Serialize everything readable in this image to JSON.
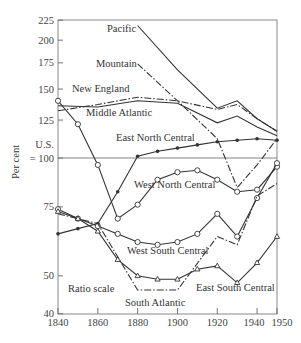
{
  "chart_data": {
    "type": "line",
    "title": "",
    "xlabel": "",
    "ylabel": "Per cent",
    "reference_label": [
      "U.S.",
      "= 100"
    ],
    "scale_note": "Ratio scale",
    "yscale": "log",
    "xlim": [
      1840,
      1950
    ],
    "ylim": [
      40,
      225
    ],
    "x_ticks": [
      1840,
      1860,
      1880,
      1900,
      1920,
      1940,
      1950
    ],
    "y_ticks": [
      40,
      50,
      75,
      100,
      125,
      150,
      175,
      200,
      225
    ],
    "series": [
      {
        "name": "Pacific",
        "style": "solid",
        "marker": "none",
        "x": [
          1880,
          1900,
          1920,
          1930,
          1940,
          1950
        ],
        "values": [
          218,
          168,
          134,
          140,
          126,
          117
        ]
      },
      {
        "name": "Mountain",
        "style": "dashdot",
        "marker": "none",
        "x": [
          1880,
          1900,
          1920,
          1930,
          1940,
          1950
        ],
        "values": [
          174,
          140,
          112,
          84,
          96,
          112
        ]
      },
      {
        "name": "New England",
        "style": "dashdot",
        "marker": "none",
        "x": [
          1840,
          1860,
          1880,
          1900,
          1920,
          1930,
          1940,
          1950
        ],
        "values": [
          132,
          137,
          143,
          140,
          133,
          137,
          126,
          117
        ]
      },
      {
        "name": "Middle Atlantic",
        "style": "solid",
        "marker": "none",
        "x": [
          1840,
          1860,
          1880,
          1900,
          1920,
          1930,
          1940,
          1950
        ],
        "values": [
          136,
          135,
          140,
          138,
          123,
          128,
          120,
          114
        ]
      },
      {
        "name": "East North Central",
        "style": "solid",
        "marker": "filled-circle",
        "x": [
          1840,
          1850,
          1860,
          1870,
          1880,
          1890,
          1900,
          1910,
          1920,
          1930,
          1940,
          1950
        ],
        "values": [
          64,
          66,
          68,
          82,
          101,
          104,
          106,
          108,
          110,
          111,
          112,
          111
        ]
      },
      {
        "name": "West North Central",
        "style": "solid",
        "marker": "open-circle",
        "x": [
          1840,
          1850,
          1860,
          1870,
          1880,
          1890,
          1900,
          1910,
          1920,
          1930,
          1940,
          1950
        ],
        "values": [
          140,
          122,
          96,
          70,
          76,
          88,
          92,
          93,
          88,
          82,
          83,
          95
        ]
      },
      {
        "name": "West South Central",
        "style": "solid",
        "marker": "open-circle",
        "x": [
          1840,
          1850,
          1860,
          1870,
          1880,
          1890,
          1900,
          1910,
          1920,
          1930,
          1940,
          1950
        ],
        "values": [
          74,
          70,
          67,
          64,
          61,
          60,
          61,
          64,
          72,
          63,
          79,
          97
        ]
      },
      {
        "name": "South Atlantic",
        "style": "dashdot",
        "marker": "none",
        "x": [
          1840,
          1860,
          1880,
          1900,
          1920,
          1930,
          1940,
          1950
        ],
        "values": [
          72,
          68,
          46,
          46,
          63,
          60,
          80,
          86
        ]
      },
      {
        "name": "East South Central",
        "style": "solid",
        "marker": "open-triangle",
        "x": [
          1840,
          1850,
          1860,
          1870,
          1880,
          1890,
          1900,
          1910,
          1920,
          1930,
          1940,
          1950
        ],
        "values": [
          73,
          70,
          65,
          55,
          50,
          49,
          49,
          52,
          53,
          48,
          54,
          63
        ]
      }
    ]
  }
}
